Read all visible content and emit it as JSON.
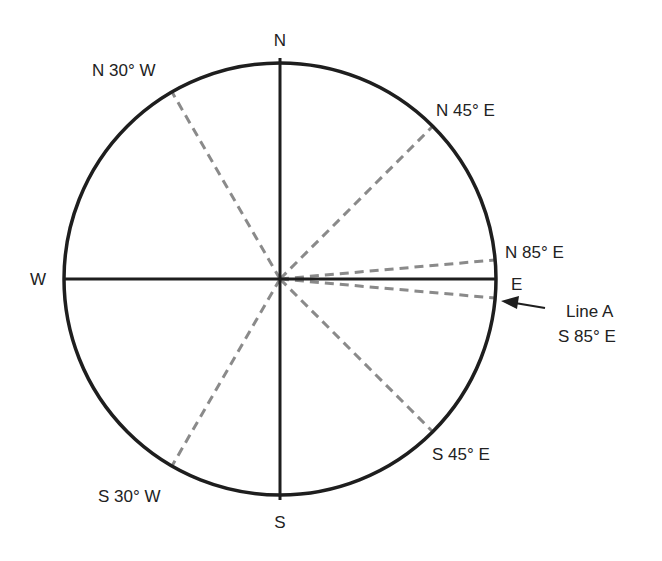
{
  "diagram": {
    "colors": {
      "circle": "#1e1e1e",
      "axes": "#1e1e1e",
      "bearings": "#8a8a8a",
      "text": "#222222"
    },
    "cardinals": {
      "north": "N",
      "south": "S",
      "east": "E",
      "west": "W"
    },
    "bearings": [
      {
        "label": "N 30° W",
        "angle_deg": -30
      },
      {
        "label": "N 45° E",
        "angle_deg": 45
      },
      {
        "label": "N 85° E",
        "angle_deg": 85
      },
      {
        "label": "S 85° E",
        "angle_deg": 95
      },
      {
        "label": "S 45° E",
        "angle_deg": 135
      },
      {
        "label": "S 30° W",
        "angle_deg": 210
      }
    ],
    "callout": {
      "name": "Line A",
      "bearing": "S 85° E"
    }
  }
}
